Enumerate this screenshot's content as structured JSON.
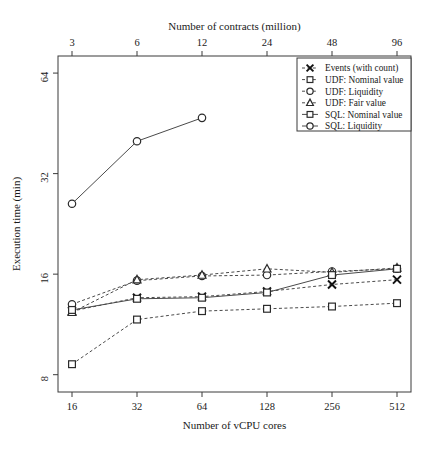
{
  "figure": {
    "background": "#ffffff",
    "ink_color": "#3a3a3a"
  },
  "chart_data": {
    "type": "line",
    "title": "",
    "xlabel": "Number of vCPU cores",
    "ylabel": "Execution time (min)",
    "secondary_xlabel": "Number of contracts (million)",
    "x": [
      16,
      32,
      64,
      128,
      256,
      512
    ],
    "categories": [
      "16",
      "32",
      "64",
      "128",
      "256",
      "512"
    ],
    "xtick_labels": [
      "16",
      "32",
      "64",
      "128",
      "256",
      "512"
    ],
    "secondary_xtick_labels": [
      "3",
      "6",
      "12",
      "24",
      "48",
      "96"
    ],
    "ytick_labels": [
      "8",
      "16",
      "32",
      "64"
    ],
    "ytick_values": [
      8,
      16,
      32,
      64
    ],
    "yscale": "log2",
    "ylim": [
      7.1,
      72
    ],
    "xscale": "log2-categorical",
    "grid": false,
    "legend_position": "top-right",
    "series": [
      {
        "name": "Events (with count)",
        "marker": "x",
        "linestyle": "dashed",
        "values": [
          12.4,
          13.6,
          13.7,
          14.2,
          14.9,
          15.4
        ]
      },
      {
        "name": "UDF: Nominal value",
        "marker": "square",
        "linestyle": "dashed",
        "values": [
          8.6,
          11.7,
          12.4,
          12.6,
          12.8,
          13.1
        ]
      },
      {
        "name": "UDF: Liquidity",
        "marker": "circle",
        "linestyle": "dashed",
        "values": [
          13.0,
          15.3,
          15.8,
          15.9,
          16.3,
          16.6
        ]
      },
      {
        "name": "UDF: Fair value",
        "marker": "triangle",
        "linestyle": "dashed",
        "values": [
          12.3,
          15.4,
          15.9,
          16.6,
          16.2,
          16.7
        ]
      },
      {
        "name": "SQL: Nominal value",
        "marker": "square",
        "linestyle": "solid",
        "values": [
          12.5,
          13.5,
          13.6,
          14.1,
          15.9,
          16.6
        ]
      },
      {
        "name": "SQL: Liquidity",
        "marker": "circle",
        "linestyle": "solid",
        "values": [
          26.0,
          40.0,
          47.0,
          null,
          null,
          null
        ]
      }
    ]
  },
  "legend": {
    "entries": [
      {
        "label": "Events (with count)",
        "marker": "x",
        "linestyle": "dashed"
      },
      {
        "label": "UDF: Nominal value",
        "marker": "square",
        "linestyle": "dashed"
      },
      {
        "label": "UDF: Liquidity",
        "marker": "circle",
        "linestyle": "dashed"
      },
      {
        "label": "UDF: Fair value",
        "marker": "triangle",
        "linestyle": "dashed"
      },
      {
        "label": "SQL: Nominal value",
        "marker": "square",
        "linestyle": "solid"
      },
      {
        "label": "SQL: Liquidity",
        "marker": "circle",
        "linestyle": "solid"
      }
    ]
  },
  "caption_fragment": ""
}
